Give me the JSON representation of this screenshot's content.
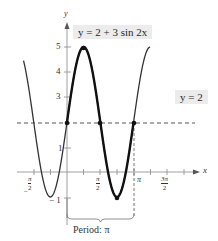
{
  "chart_data": {
    "type": "line",
    "title": "",
    "function_label": "y = 2 + 3 sin 2x",
    "reference_line_label": "y = 2",
    "annotation": "Period: π",
    "xlabel": "x",
    "ylabel": "y",
    "x_ticks": [
      "-π/2",
      "π/2",
      "π",
      "3π/2"
    ],
    "y_ticks": [
      "-1",
      "1",
      "3",
      "4",
      "5"
    ],
    "xlim": [
      -2.0,
      4.3
    ],
    "ylim": [
      -1.3,
      5.6
    ],
    "grid": false,
    "series": [
      {
        "name": "y = 2 + 3 sin 2x",
        "x": [
          -1.5708,
          -0.7854,
          0,
          0.7854,
          1.5708,
          2.3562,
          3.1416,
          3.927,
          4.7124
        ],
        "values": [
          2,
          -1,
          2,
          5,
          2,
          -1,
          2,
          5,
          2
        ],
        "bold_range": [
          0,
          3.1416
        ]
      },
      {
        "name": "y = 2",
        "style": "dashed",
        "x": [
          -2.0,
          4.3
        ],
        "values": [
          2,
          2
        ]
      }
    ],
    "marked_points": [
      {
        "x": 0,
        "y": 2
      },
      {
        "x": 0.7854,
        "y": 5
      },
      {
        "x": 1.5708,
        "y": 2
      },
      {
        "x": 2.3562,
        "y": -1
      },
      {
        "x": 3.1416,
        "y": 2
      }
    ],
    "period_bracket": {
      "from": 0,
      "to": 3.1416
    }
  },
  "labels": {
    "equation": "y = 2 + 3 sin 2x",
    "midline": "y = 2",
    "period": "Period: π",
    "x_axis": "x",
    "y_axis": "y",
    "tick_neg_half_pi_num": "π",
    "tick_half_pi_num": "π",
    "tick_pi": "π",
    "tick_three_half_pi_num": "3π",
    "tick_den": "2",
    "minus": "−",
    "y1": "1",
    "y3": "3",
    "y4": "4",
    "y5": "5",
    "yneg1": "− 1"
  }
}
